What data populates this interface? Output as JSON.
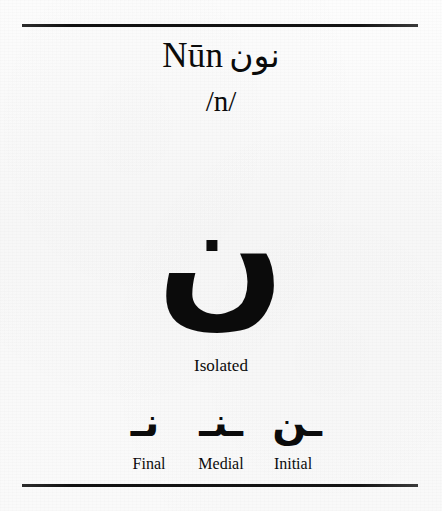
{
  "page": {
    "background_color": "#fbfbfb",
    "ink_color": "#0b0b0b",
    "rule_color": "#111111"
  },
  "header": {
    "romanized_name": "Nūn",
    "arabic_name": "نون",
    "phoneme": "/n/"
  },
  "isolated": {
    "glyph": "ن",
    "label": "Isolated"
  },
  "forms": [
    {
      "label": "Final",
      "glyph": "ـن"
    },
    {
      "label": "Medial",
      "glyph": "ـنـ"
    },
    {
      "label": "Initial",
      "glyph": "نـ"
    }
  ]
}
